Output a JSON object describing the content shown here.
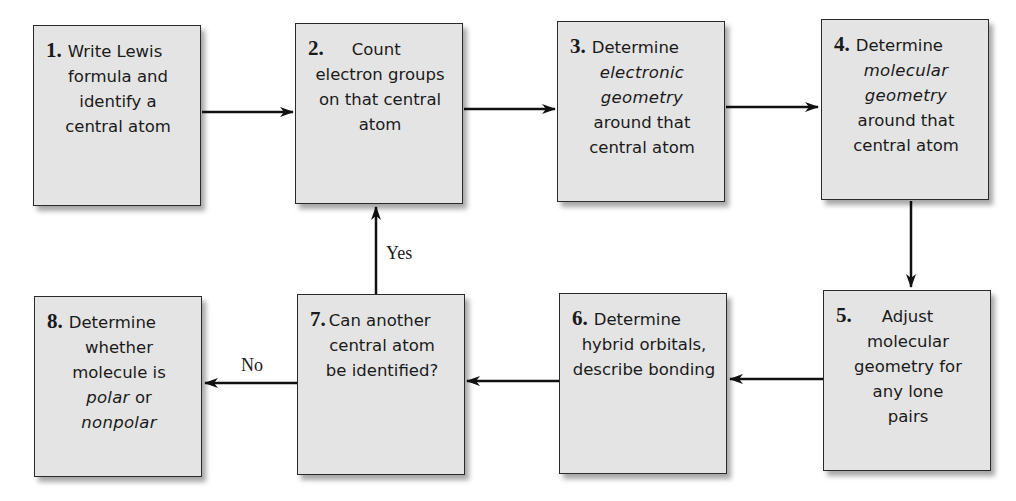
{
  "diagram": {
    "type": "flowchart",
    "steps": [
      {
        "number": "1.",
        "lines": [
          "Write Lewis",
          "formula and",
          "identify a",
          "central atom"
        ]
      },
      {
        "number": "2.",
        "lines": [
          "Count",
          "electron groups",
          "on that central",
          "atom"
        ]
      },
      {
        "number": "3.",
        "lines": [
          "Determine",
          "electronic",
          "geometry",
          "around that",
          "central atom"
        ]
      },
      {
        "number": "4.",
        "lines": [
          "Determine",
          "molecular",
          "geometry",
          "around that",
          "central atom"
        ]
      },
      {
        "number": "5.",
        "lines": [
          "Adjust",
          "molecular",
          "geometry for",
          "any lone",
          "pairs"
        ]
      },
      {
        "number": "6.",
        "lines": [
          "Determine",
          "hybrid orbitals,",
          "describe bonding"
        ]
      },
      {
        "number": "7.",
        "lines": [
          "Can another",
          "central atom",
          "be identified?"
        ]
      },
      {
        "number": "8.",
        "lines": [
          "Determine",
          "whether",
          "molecule is",
          "polar",
          "or",
          "nonpolar"
        ]
      }
    ],
    "labels": {
      "yes": "Yes",
      "no": "No"
    },
    "connections": [
      {
        "from": 1,
        "to": 2
      },
      {
        "from": 2,
        "to": 3
      },
      {
        "from": 3,
        "to": 4
      },
      {
        "from": 4,
        "to": 5
      },
      {
        "from": 5,
        "to": 6
      },
      {
        "from": 6,
        "to": 7
      },
      {
        "from": 7,
        "to": 2,
        "label": "Yes"
      },
      {
        "from": 7,
        "to": 8,
        "label": "No"
      }
    ],
    "colors": {
      "box_fill": "#e4e4e4",
      "box_border": "#2a2a2a",
      "arrow": "#111111",
      "text": "#1a1a1a"
    }
  }
}
